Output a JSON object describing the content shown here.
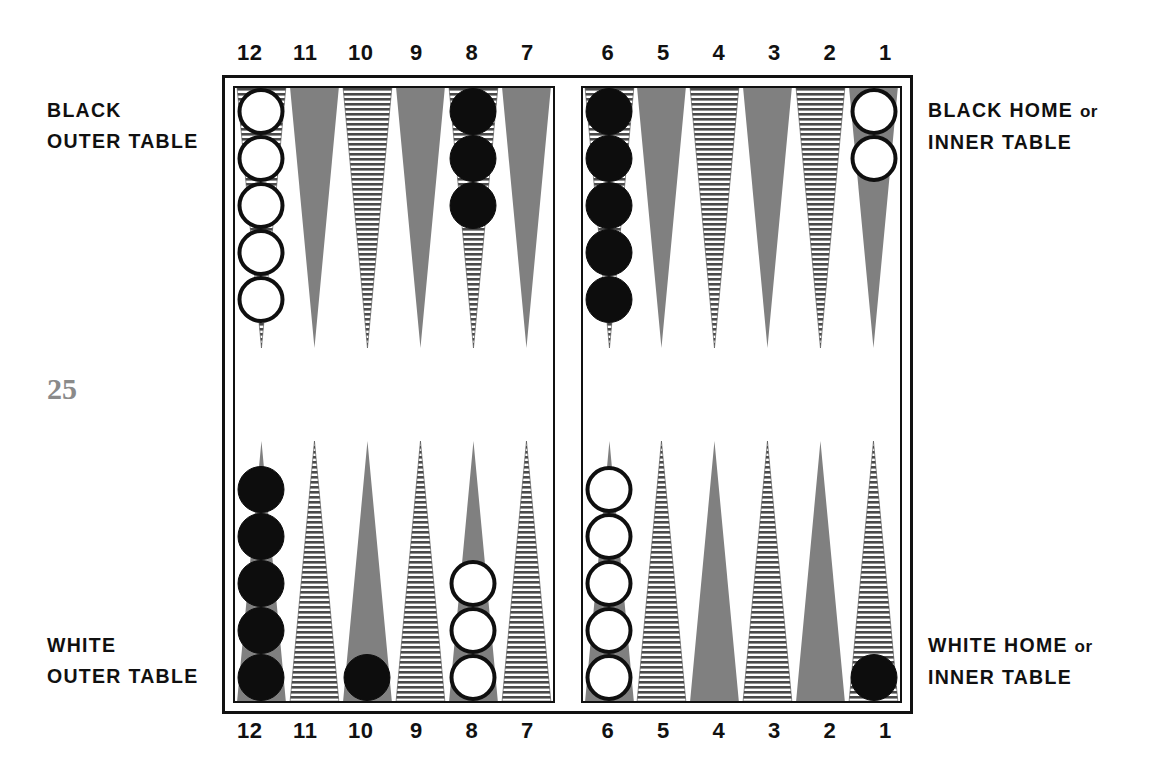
{
  "page_number": "25",
  "labels": {
    "top_left": {
      "line1": "BLACK",
      "line2": "OUTER TABLE"
    },
    "bottom_left": {
      "line1": "WHITE",
      "line2": "OUTER TABLE"
    },
    "top_right": {
      "line1": "BLACK HOME",
      "conj": "or",
      "line2": "INNER TABLE"
    },
    "bottom_right": {
      "line1": "WHITE HOME",
      "conj": "or",
      "line2": "INNER TABLE"
    }
  },
  "point_numbers": {
    "left_half": [
      "12",
      "11",
      "10",
      "9",
      "8",
      "7"
    ],
    "right_half": [
      "6",
      "5",
      "4",
      "3",
      "2",
      "1"
    ]
  },
  "colors": {
    "point_solid": "#808080",
    "point_hatch_line": "#4a4a4a",
    "point_hatch_bg": "#ffffff",
    "checker_black": "#0d0d0d",
    "checker_white": "#ffffff",
    "frame": "#111111",
    "page_number": "#8a8a8a"
  },
  "board": {
    "top_row": [
      {
        "number": "12",
        "half": "left",
        "style": "hatched",
        "checkers": 5,
        "color": "white"
      },
      {
        "number": "11",
        "half": "left",
        "style": "solid",
        "checkers": 0,
        "color": null
      },
      {
        "number": "10",
        "half": "left",
        "style": "hatched",
        "checkers": 0,
        "color": null
      },
      {
        "number": "9",
        "half": "left",
        "style": "solid",
        "checkers": 0,
        "color": null
      },
      {
        "number": "8",
        "half": "left",
        "style": "hatched",
        "checkers": 3,
        "color": "black"
      },
      {
        "number": "7",
        "half": "left",
        "style": "solid",
        "checkers": 0,
        "color": null
      },
      {
        "number": "6",
        "half": "right",
        "style": "hatched",
        "checkers": 5,
        "color": "black"
      },
      {
        "number": "5",
        "half": "right",
        "style": "solid",
        "checkers": 0,
        "color": null
      },
      {
        "number": "4",
        "half": "right",
        "style": "hatched",
        "checkers": 0,
        "color": null
      },
      {
        "number": "3",
        "half": "right",
        "style": "solid",
        "checkers": 0,
        "color": null
      },
      {
        "number": "2",
        "half": "right",
        "style": "hatched",
        "checkers": 0,
        "color": null
      },
      {
        "number": "1",
        "half": "right",
        "style": "solid",
        "checkers": 2,
        "color": "white"
      }
    ],
    "bottom_row": [
      {
        "number": "12",
        "half": "left",
        "style": "solid",
        "checkers": 5,
        "color": "black"
      },
      {
        "number": "11",
        "half": "left",
        "style": "hatched",
        "checkers": 0,
        "color": null
      },
      {
        "number": "10",
        "half": "left",
        "style": "solid",
        "checkers": 1,
        "color": "black"
      },
      {
        "number": "9",
        "half": "left",
        "style": "hatched",
        "checkers": 0,
        "color": null
      },
      {
        "number": "8",
        "half": "left",
        "style": "solid",
        "checkers": 3,
        "color": "white"
      },
      {
        "number": "7",
        "half": "left",
        "style": "hatched",
        "checkers": 0,
        "color": null
      },
      {
        "number": "6",
        "half": "right",
        "style": "solid",
        "checkers": 5,
        "color": "white"
      },
      {
        "number": "5",
        "half": "right",
        "style": "hatched",
        "checkers": 0,
        "color": null
      },
      {
        "number": "4",
        "half": "right",
        "style": "solid",
        "checkers": 0,
        "color": null
      },
      {
        "number": "3",
        "half": "right",
        "style": "hatched",
        "checkers": 0,
        "color": null
      },
      {
        "number": "2",
        "half": "right",
        "style": "solid",
        "checkers": 0,
        "color": null
      },
      {
        "number": "1",
        "half": "right",
        "style": "hatched",
        "checkers": 1,
        "color": "black"
      }
    ]
  }
}
